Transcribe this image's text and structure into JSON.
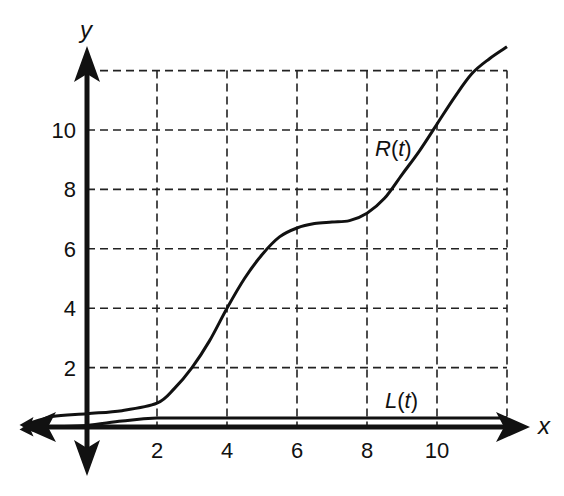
{
  "chart_data": {
    "type": "line",
    "title": "",
    "xlabel": "x",
    "ylabel": "y",
    "xlim": [
      -2,
      12.8
    ],
    "ylim": [
      -1.5,
      12.8
    ],
    "grid": true,
    "grid_style": "dashed",
    "x_ticks": [
      2,
      4,
      6,
      8,
      10
    ],
    "y_ticks": [
      2,
      4,
      6,
      8,
      10
    ],
    "grid_x": [
      2,
      4,
      6,
      8,
      10,
      12
    ],
    "grid_y": [
      2,
      4,
      6,
      8,
      10,
      12
    ],
    "series": [
      {
        "name": "R(t)",
        "x": [
          -1.7,
          -1,
          0,
          1,
          2,
          2.5,
          3,
          3.5,
          4,
          4.5,
          5,
          5.5,
          6,
          6.5,
          7,
          7.5,
          8,
          8.5,
          9,
          9.5,
          10,
          10.5,
          11,
          11.5,
          12
        ],
        "values": [
          0.1,
          0.35,
          0.45,
          0.55,
          0.8,
          1.3,
          2.0,
          2.9,
          4.0,
          5.0,
          5.8,
          6.4,
          6.7,
          6.85,
          6.9,
          6.95,
          7.2,
          7.7,
          8.5,
          9.3,
          10.2,
          11.1,
          11.9,
          12.4,
          12.8
        ]
      },
      {
        "name": "L(t)",
        "x": [
          -1.7,
          -1,
          0,
          1,
          2,
          4,
          6,
          8,
          10,
          12
        ],
        "values": [
          -0.05,
          0.0,
          0.05,
          0.2,
          0.3,
          0.3,
          0.3,
          0.3,
          0.3,
          0.3
        ]
      }
    ],
    "annotations": [
      {
        "text": "R(t)",
        "x": 9.3,
        "y": 9.5
      },
      {
        "text": "L(t)",
        "x": 9.0,
        "y": 0.9
      }
    ]
  },
  "labels": {
    "x_axis": "x",
    "y_axis": "y",
    "r_label": "R(",
    "r_t": "t",
    "l_label": "L(",
    "l_t": "t",
    "close_paren": ")"
  }
}
